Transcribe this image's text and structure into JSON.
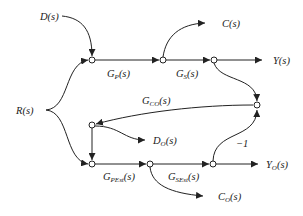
{
  "diagram": {
    "type": "signal-flow-graph",
    "inputs": {
      "disturbance": "D(s)",
      "reference": "R(s)"
    },
    "outputs": {
      "control": "C(s)",
      "output": "Y(s)",
      "model_disturbance": {
        "main": "D",
        "sub": "O",
        "tail": "(s)"
      },
      "model_output": {
        "main": "Y",
        "sub": "O",
        "tail": "(s)"
      },
      "model_control": {
        "main": "C",
        "sub": "O",
        "tail": "(s)"
      }
    },
    "gains": {
      "gp": {
        "main": "G",
        "sub": "P",
        "tail": "(s)"
      },
      "gs": {
        "main": "G",
        "sub": "S",
        "tail": "(s)"
      },
      "gco": {
        "main": "G",
        "sub": "CO",
        "tail": "(s)"
      },
      "gpest": {
        "main": "G",
        "sub": "PEst",
        "tail": "(s)"
      },
      "gsest": {
        "main": "G",
        "sub": "SEst",
        "tail": "(s)"
      },
      "neg": "−1"
    },
    "colors": {
      "stroke": "#222222",
      "background": "#ffffff"
    }
  }
}
